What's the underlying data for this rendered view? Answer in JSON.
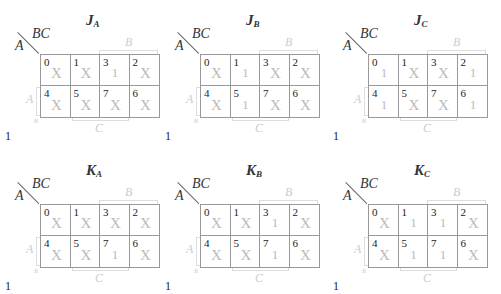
{
  "labels": {
    "bc": "BC",
    "a": "A",
    "b_bracket": "B",
    "c_bracket": "C",
    "a_bracket": "A",
    "corner_small": "B",
    "footer": "1"
  },
  "cell_order": [
    0,
    1,
    3,
    2,
    4,
    5,
    7,
    6
  ],
  "maps": [
    {
      "name": "J",
      "subscript": "A",
      "values": [
        "X",
        "X",
        "1",
        "X",
        "X",
        "X",
        "X",
        "X"
      ]
    },
    {
      "name": "J",
      "subscript": "B",
      "values": [
        "X",
        "1",
        "X",
        "X",
        "X",
        "1",
        "X",
        "X"
      ]
    },
    {
      "name": "J",
      "subscript": "C",
      "values": [
        "1",
        "X",
        "X",
        "1",
        "1",
        "X",
        "X",
        "1"
      ]
    },
    {
      "name": "K",
      "subscript": "A",
      "values": [
        "X",
        "X",
        "X",
        "X",
        "X",
        "X",
        "1",
        "X"
      ]
    },
    {
      "name": "K",
      "subscript": "B",
      "values": [
        "X",
        "X",
        "1",
        "X",
        "X",
        "X",
        "1",
        "X"
      ]
    },
    {
      "name": "K",
      "subscript": "C",
      "values": [
        "X",
        "1",
        "1",
        "X",
        "X",
        "1",
        "1",
        "X"
      ]
    }
  ]
}
